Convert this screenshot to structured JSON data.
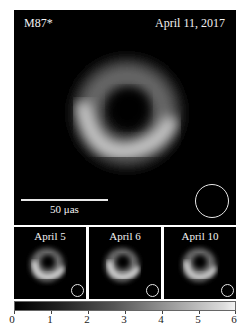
{
  "main_panel": {
    "title": "M87*",
    "date": "April 11, 2017",
    "scale_bar_label": "50 μas"
  },
  "sub_panels": [
    {
      "label": "April 5"
    },
    {
      "label": "April 6"
    },
    {
      "label": "April 10"
    }
  ],
  "colorbar": {
    "ticks": [
      "0",
      "1",
      "2",
      "3",
      "4",
      "5",
      "6"
    ],
    "colormap": [
      "#000000",
      "#f2f2f2"
    ]
  }
}
